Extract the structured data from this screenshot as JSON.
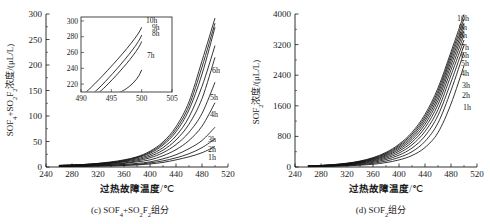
{
  "figure": {
    "panels": [
      {
        "id": "c",
        "caption": "(c) SOF₄+SO₂F₂组分",
        "ylabel": "SOF₄+SO₂F₂浓度/(μL/L)",
        "xlabel_main": "过热故障温度",
        "xlabel_unit": "/℃",
        "xticks": [
          240,
          280,
          320,
          360,
          400,
          440,
          480,
          520
        ],
        "yticks": [
          0,
          50,
          100,
          150,
          200,
          250,
          300
        ],
        "xlim": [
          240,
          520
        ],
        "ylim": [
          0,
          300
        ],
        "curve_labels": [
          "1h",
          "2h",
          "3h",
          "4h",
          "5h",
          "6h"
        ],
        "inset": {
          "xticks": [
            490,
            495,
            500,
            505
          ],
          "yticks": [
            220,
            240,
            260,
            280,
            300
          ],
          "xlim": [
            490,
            505
          ],
          "ylim": [
            210,
            305
          ],
          "curve_labels": [
            "7h",
            "8h",
            "9h",
            "10h"
          ]
        }
      },
      {
        "id": "d",
        "caption": "(d) SOF₂组分",
        "ylabel": "SOF₂浓度/(μL/L)",
        "xlabel_main": "过热故障温度",
        "xlabel_unit": "/℃",
        "xticks": [
          240,
          280,
          320,
          360,
          400,
          440,
          480,
          520
        ],
        "yticks": [
          0,
          800,
          1600,
          2400,
          3200,
          4000
        ],
        "xlim": [
          240,
          520
        ],
        "ylim": [
          0,
          4000
        ],
        "curve_labels": [
          "1h",
          "2h",
          "3h",
          "4h",
          "5h",
          "6h",
          "7h",
          "8h",
          "9h",
          "10h"
        ]
      }
    ],
    "colors": {
      "ink": "#111111",
      "background": "#ffffff"
    }
  },
  "chart_data": [
    {
      "type": "line",
      "id": "panel-c",
      "title": "(c) SOF4+SO2F2组分",
      "xlabel": "过热故障温度/℃",
      "ylabel": "SOF4+SO2F2浓度/(μL/L)",
      "xlim": [
        240,
        520
      ],
      "ylim": [
        0,
        300
      ],
      "grid": false,
      "legend": "inline-right-of-curves",
      "x": [
        260,
        280,
        300,
        320,
        340,
        360,
        380,
        400,
        420,
        440,
        460,
        480,
        500
      ],
      "series": [
        {
          "name": "1h",
          "values": [
            1,
            1,
            1,
            2,
            2,
            3,
            4,
            6,
            9,
            14,
            20,
            28,
            40
          ]
        },
        {
          "name": "2h",
          "values": [
            1,
            1,
            2,
            2,
            3,
            4,
            5,
            8,
            12,
            18,
            26,
            38,
            55
          ]
        },
        {
          "name": "3h",
          "values": [
            1,
            2,
            2,
            3,
            4,
            5,
            7,
            10,
            16,
            24,
            36,
            52,
            78
          ]
        },
        {
          "name": "4h",
          "values": [
            2,
            2,
            3,
            4,
            5,
            7,
            10,
            14,
            22,
            34,
            52,
            80,
            126
          ]
        },
        {
          "name": "5h",
          "values": [
            2,
            3,
            3,
            4,
            6,
            8,
            12,
            18,
            28,
            44,
            68,
            105,
            166
          ]
        },
        {
          "name": "6h",
          "values": [
            2,
            3,
            4,
            5,
            7,
            10,
            14,
            21,
            33,
            53,
            84,
            134,
            215
          ]
        },
        {
          "name": "7h",
          "values": [
            3,
            3,
            4,
            6,
            8,
            11,
            16,
            24,
            38,
            61,
            98,
            158,
            238
          ]
        },
        {
          "name": "8h",
          "values": [
            3,
            4,
            5,
            6,
            9,
            12,
            18,
            27,
            43,
            69,
            112,
            182,
            274
          ]
        },
        {
          "name": "9h",
          "values": [
            3,
            4,
            5,
            7,
            9,
            13,
            19,
            29,
            46,
            74,
            120,
            196,
            282
          ]
        },
        {
          "name": "10h",
          "values": [
            3,
            4,
            5,
            7,
            10,
            14,
            20,
            31,
            49,
            79,
            128,
            208,
            292
          ]
        }
      ],
      "inset": {
        "xlim": [
          490,
          505
        ],
        "ylim": [
          210,
          305
        ],
        "xticks": [
          490,
          495,
          500,
          505
        ],
        "yticks": [
          220,
          240,
          260,
          280,
          300
        ],
        "series": [
          {
            "name": "7h",
            "x": [
              496.4,
              500.0
            ],
            "y": [
              210,
              238
            ]
          },
          {
            "name": "8h",
            "x": [
              493.0,
              500.0
            ],
            "y": [
              210,
              274
            ]
          },
          {
            "name": "9h",
            "x": [
              492.2,
              500.0
            ],
            "y": [
              210,
              282
            ]
          },
          {
            "name": "10h",
            "x": [
              490.8,
              500.0
            ],
            "y": [
              210,
              292
            ]
          }
        ]
      }
    },
    {
      "type": "line",
      "id": "panel-d",
      "title": "(d) SOF2组分",
      "xlabel": "过热故障温度/℃",
      "ylabel": "SOF2浓度/(μL/L)",
      "xlim": [
        240,
        520
      ],
      "ylim": [
        0,
        4000
      ],
      "grid": false,
      "legend": "inline-right-of-curves",
      "x": [
        260,
        280,
        300,
        320,
        340,
        360,
        380,
        400,
        420,
        440,
        460,
        480,
        500
      ],
      "series": [
        {
          "name": "1h",
          "values": [
            10,
            14,
            20,
            30,
            46,
            72,
            115,
            185,
            300,
            510,
            900,
            1650,
            2650
          ]
        },
        {
          "name": "2h",
          "values": [
            12,
            18,
            26,
            40,
            62,
            98,
            155,
            250,
            400,
            670,
            1150,
            2000,
            3000
          ]
        },
        {
          "name": "3h",
          "values": [
            14,
            22,
            32,
            50,
            78,
            122,
            195,
            310,
            495,
            810,
            1350,
            2220,
            3180
          ]
        },
        {
          "name": "4h",
          "values": [
            16,
            25,
            38,
            58,
            92,
            145,
            230,
            365,
            580,
            930,
            1500,
            2400,
            3320
          ]
        },
        {
          "name": "5h",
          "values": [
            18,
            28,
            43,
            66,
            104,
            165,
            262,
            415,
            650,
            1030,
            1630,
            2540,
            3450
          ]
        },
        {
          "name": "6h",
          "values": [
            20,
            31,
            48,
            74,
            116,
            184,
            290,
            458,
            712,
            1115,
            1740,
            2660,
            3560
          ]
        },
        {
          "name": "7h",
          "values": [
            22,
            34,
            52,
            81,
            127,
            200,
            315,
            496,
            766,
            1190,
            1830,
            2760,
            3660
          ]
        },
        {
          "name": "8h",
          "values": [
            24,
            37,
            57,
            88,
            137,
            216,
            339,
            530,
            815,
            1255,
            1915,
            2850,
            3760
          ]
        },
        {
          "name": "9h",
          "values": [
            26,
            40,
            61,
            94,
            147,
            230,
            360,
            562,
            860,
            1315,
            1990,
            2930,
            3870
          ]
        },
        {
          "name": "10h",
          "values": [
            28,
            43,
            65,
            100,
            156,
            244,
            382,
            594,
            905,
            1375,
            2065,
            3010,
            3990
          ]
        }
      ]
    }
  ]
}
